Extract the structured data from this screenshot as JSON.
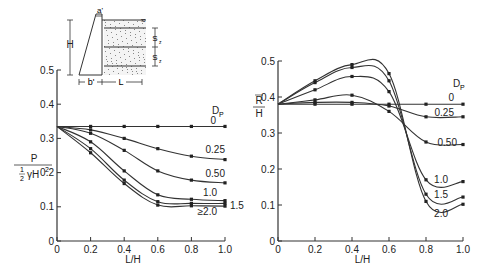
{
  "chart_data": [
    {
      "type": "line",
      "title": "",
      "xlabel": "L/H",
      "ylabel": "P / (1/2 γ H^2)",
      "xlim": [
        0,
        1.0
      ],
      "ylim": [
        0,
        0.5
      ],
      "xticks": [
        "0",
        "0.2",
        "0.4",
        "0.6",
        "0.8",
        "1.0"
      ],
      "yticks": [
        "0",
        "0.1",
        "0.2",
        "0.3",
        "0.4",
        "0.5"
      ],
      "grid": false,
      "legend_title": "DP",
      "x": [
        0,
        0.2,
        0.4,
        0.6,
        0.8,
        1.0
      ],
      "series": [
        {
          "name": "0",
          "values": [
            0.335,
            0.335,
            0.335,
            0.335,
            0.335,
            0.335
          ]
        },
        {
          "name": "0.25",
          "values": [
            0.335,
            0.325,
            0.3,
            0.27,
            0.248,
            0.238
          ]
        },
        {
          "name": "0.50",
          "values": [
            0.335,
            0.315,
            0.265,
            0.205,
            0.178,
            0.17
          ]
        },
        {
          "name": "1.0",
          "values": [
            0.335,
            0.29,
            0.205,
            0.135,
            0.122,
            0.118
          ]
        },
        {
          "name": "1.5",
          "values": [
            0.335,
            0.27,
            0.178,
            0.115,
            0.11,
            0.11
          ]
        },
        {
          "name": "≥2.0",
          "values": [
            0.335,
            0.258,
            0.168,
            0.105,
            0.103,
            0.102
          ]
        }
      ],
      "inset_diagram": {
        "labels": [
          "a'",
          "H",
          "b'",
          "L",
          "Sz",
          "Sz"
        ]
      }
    },
    {
      "type": "line",
      "title": "",
      "xlabel": "L/H",
      "ylabel": "R̄ / H",
      "xlim": [
        0,
        1.0
      ],
      "ylim": [
        0,
        0.5
      ],
      "xticks": [
        "0",
        "0.2",
        "0.4",
        "0.6",
        "0.8",
        "1.0"
      ],
      "yticks": [
        "0",
        "0.1",
        "0.2",
        "0.3",
        "0.4",
        "0.5"
      ],
      "grid": false,
      "legend_title": "DP",
      "x": [
        0,
        0.2,
        0.4,
        0.6,
        0.8,
        1.0
      ],
      "series": [
        {
          "name": "0",
          "values": [
            0.38,
            0.38,
            0.38,
            0.38,
            0.38,
            0.38
          ]
        },
        {
          "name": "0.25",
          "values": [
            0.38,
            0.385,
            0.385,
            0.375,
            0.345,
            0.345
          ]
        },
        {
          "name": "0.50",
          "values": [
            0.38,
            0.392,
            0.405,
            0.36,
            0.275,
            0.268
          ]
        },
        {
          "name": "1.0",
          "values": [
            0.38,
            0.42,
            0.457,
            0.415,
            0.17,
            0.165
          ]
        },
        {
          "name": "1.5",
          "values": [
            0.38,
            0.44,
            0.482,
            0.445,
            0.13,
            0.122
          ]
        },
        {
          "name": "2.0",
          "values": [
            0.38,
            0.445,
            0.49,
            0.465,
            0.11,
            0.102
          ]
        }
      ]
    }
  ],
  "left": {
    "ylabel_num": "P",
    "ylabel_half_num": "1",
    "ylabel_half_den": "2",
    "ylabel_rest": "γH",
    "ylabel_sup": "2",
    "legend_title": "D",
    "legend_sub": "P",
    "inset": {
      "a": "a'",
      "h": "H",
      "b": "b'",
      "l": "L",
      "s1": "S",
      "s2": "S",
      "sub": "z"
    }
  },
  "right": {
    "ylabel_num": "R",
    "ylabel_den": "H",
    "legend_title": "D",
    "legend_sub": "P"
  }
}
